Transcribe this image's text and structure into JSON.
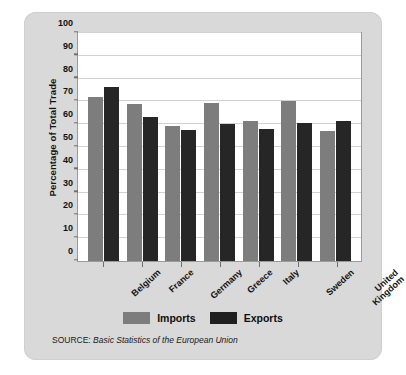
{
  "chart_data": {
    "type": "bar",
    "title": "",
    "xlabel": "",
    "ylabel": "Percentage of Total Trade",
    "ylim": [
      0,
      100
    ],
    "ytick_step": 10,
    "yticks": [
      "0",
      "10",
      "20",
      "30",
      "40",
      "50",
      "60",
      "70",
      "80",
      "90",
      "100"
    ],
    "grid": true,
    "legend_position": "bottom-center",
    "categories": [
      "Belgium",
      "France",
      "Germany",
      "Greece",
      "Italy",
      "Sweden",
      "United Kingdom"
    ],
    "series": [
      {
        "name": "Imports",
        "color": "#7d7d7d",
        "values": [
          72,
          69,
          59,
          69.5,
          61.5,
          70,
          57
        ]
      },
      {
        "name": "Exports",
        "color": "#262626",
        "values": [
          76.5,
          63,
          57.5,
          60,
          58,
          60.5,
          61.5
        ]
      }
    ]
  },
  "axis": {
    "y_title": "Percentage of Total Trade"
  },
  "category_labels": [
    {
      "line1": "Belgium",
      "line2": ""
    },
    {
      "line1": "France",
      "line2": ""
    },
    {
      "line1": "Germany",
      "line2": ""
    },
    {
      "line1": "Greece",
      "line2": ""
    },
    {
      "line1": "Italy",
      "line2": ""
    },
    {
      "line1": "Sweden",
      "line2": ""
    },
    {
      "line1": "United",
      "line2": "Kingdom"
    }
  ],
  "legend": {
    "items": [
      {
        "label": "Imports",
        "color": "#7d7d7d"
      },
      {
        "label": "Exports",
        "color": "#1f1f1f"
      }
    ]
  },
  "source": {
    "prefix": "SOURCE: ",
    "title": "Basic Statistics of the European Union"
  }
}
